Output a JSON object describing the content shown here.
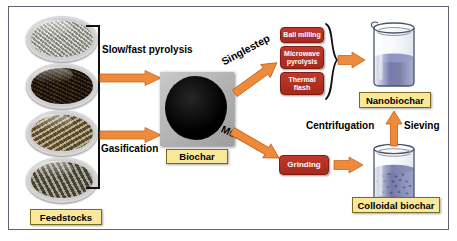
{
  "colors": {
    "arrow_orange": "#ED8A3C",
    "arrow_orange_dark": "#C96A1E",
    "box_red": "#B4301F",
    "label_yellow": "#FAE89A",
    "frame_gray": "#5D6470",
    "liquid_blue": "#3A3F8F",
    "text_black": "#000000"
  },
  "feedstocks": {
    "label": "Feedstocks",
    "items": [
      {
        "name": "dish-straw-light",
        "alt": "light straw / wood shavings in petri dish"
      },
      {
        "name": "dish-dark-compost",
        "alt": "dark compost / leaf litter in petri dish"
      },
      {
        "name": "dish-husk-brown",
        "alt": "brown husk / shell fragments in petri dish"
      },
      {
        "name": "dish-chips-gray",
        "alt": "gray wood chips in petri dish"
      }
    ]
  },
  "conversion": {
    "routes": [
      {
        "label": "Slow/fast pyrolysis"
      },
      {
        "label": "Gasification"
      }
    ]
  },
  "biochar": {
    "label": "Biochar",
    "image_alt": "black biochar sample on gray background"
  },
  "pathways": {
    "singlestep": {
      "label": "Singlestep",
      "treatments": [
        {
          "label": "Ball milling"
        },
        {
          "label": "Microwave pyrolysis"
        },
        {
          "label": "Thermal flash"
        }
      ]
    },
    "multistep": {
      "label": "Multistep",
      "treatments": [
        {
          "label": "Grinding"
        }
      ]
    }
  },
  "products": {
    "nanobiochar": {
      "label": "Nanobiochar",
      "beaker_alt": "beaker containing blue-violet nanobiochar suspension"
    },
    "colloidal": {
      "label": "Colloidal biochar",
      "beaker_alt": "beaker containing dark colloidal biochar suspension with visible particles"
    }
  },
  "separation": {
    "left_label": "Centrifugation",
    "right_label": "Sieving",
    "direction": "upward"
  }
}
